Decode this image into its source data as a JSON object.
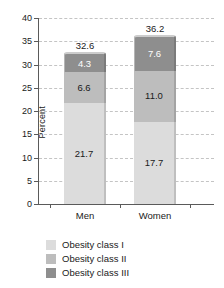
{
  "chart_data": {
    "type": "bar",
    "stacked": true,
    "title": "",
    "xlabel": "",
    "ylabel": "Percent",
    "ylim": [
      0,
      40
    ],
    "ytick_step": 5,
    "yticks": [
      "40",
      "35",
      "30",
      "25",
      "20",
      "15",
      "10",
      "5",
      "0"
    ],
    "grid": true,
    "legend_position": "bottom",
    "categories": [
      "Men",
      "Women"
    ],
    "series": [
      {
        "name": "Obesity class I",
        "values": [
          21.7,
          17.7
        ],
        "color": "#dcdcdc",
        "label_color": "#1a1a1a"
      },
      {
        "name": "Obesity class II",
        "values": [
          6.6,
          11.0
        ],
        "color": "#bdbdbd",
        "label_color": "#1a1a1a"
      },
      {
        "name": "Obesity class III",
        "values": [
          4.3,
          7.6
        ],
        "color": "#8e8e8e",
        "label_color": "#ffffff"
      }
    ],
    "segment_labels": [
      [
        "21.7",
        "6.6",
        "4.3"
      ],
      [
        "17.7",
        "11.0",
        "7.6"
      ]
    ],
    "totals": [
      "32.6",
      "36.2"
    ],
    "annotations": []
  },
  "legend": {
    "items": [
      {
        "label": "Obesity class I"
      },
      {
        "label": "Obesity class II"
      },
      {
        "label": "Obesity class III"
      }
    ]
  }
}
